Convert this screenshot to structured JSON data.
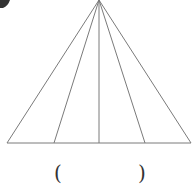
{
  "diagram": {
    "type": "triangle-fan",
    "stroke_color": "#7a7a7a",
    "apex": [
      99,
      0
    ],
    "base": {
      "y": 143,
      "x_start": 7,
      "x_end": 191
    },
    "base_points_x": [
      7,
      54,
      99,
      145,
      191
    ],
    "segment_count": 4
  },
  "answer": {
    "open_paren": "(",
    "close_paren": ")",
    "value": ""
  },
  "corner_mark": {
    "color": "#333333"
  }
}
